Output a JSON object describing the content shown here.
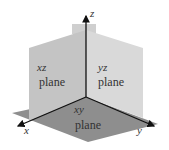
{
  "diagram": {
    "axes": {
      "x": "x",
      "y": "y",
      "z": "z"
    },
    "planes": {
      "xz": {
        "name": "xz",
        "word": "plane"
      },
      "yz": {
        "name": "yz",
        "word": "plane"
      },
      "xy": {
        "name": "xy",
        "word": "plane"
      }
    },
    "colors": {
      "xz_plane": "#c4c4c4",
      "yz_plane": "#d6d6d6",
      "xy_plane": "#8e8e8e",
      "axis": "#111111"
    }
  }
}
